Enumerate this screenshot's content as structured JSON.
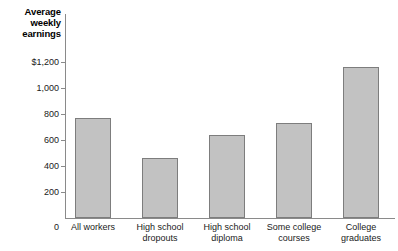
{
  "chart_data": {
    "type": "bar",
    "title": "Average weekly earnings",
    "title_lines": [
      "Average",
      "weekly",
      "earnings"
    ],
    "xlabel": "",
    "ylabel": "Average weekly earnings",
    "categories": [
      "All workers",
      "High school dropouts",
      "High school diploma",
      "Some college courses",
      "College graduates"
    ],
    "category_lines": [
      [
        "All workers"
      ],
      [
        "High school",
        "dropouts"
      ],
      [
        "High school",
        "diploma"
      ],
      [
        "Some college",
        "courses"
      ],
      [
        "College",
        "graduates"
      ]
    ],
    "values": [
      770,
      460,
      635,
      730,
      1160
    ],
    "ylim": [
      0,
      1200
    ],
    "yticks": [
      0,
      200,
      400,
      600,
      800,
      1000,
      1200
    ],
    "ytick_labels": [
      "0",
      "200",
      "400",
      "600",
      "800",
      "1,000",
      "$1,200"
    ],
    "grid": false,
    "legend": false,
    "legend_position": "none",
    "bar_fill_color": "#c2c2c2",
    "bar_edge_color": "#7d7d7d",
    "axis_color": "#8a8a8a",
    "background_color": "#ffffff"
  }
}
